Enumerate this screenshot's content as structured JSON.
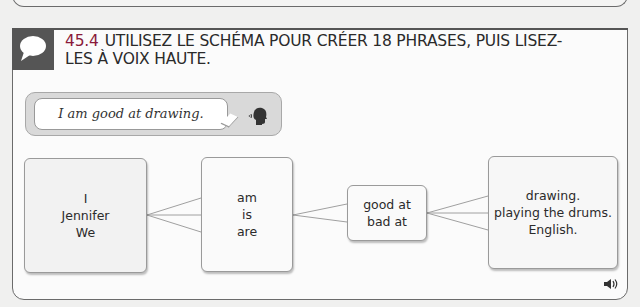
{
  "exercise": {
    "number": "45.4",
    "instruction": "UTILISEZ LE SCHÉMA POUR CRÉER 18 PHRASES, PUIS LISEZ-LES À VOIX HAUTE.",
    "badge_icon": "speech-bubble-icon",
    "example": {
      "sentence": "I am good at drawing.",
      "icon": "speaking-head-icon"
    },
    "diagram": {
      "subjects": [
        "I",
        "Jennifer",
        "We"
      ],
      "verbs": [
        "am",
        "is",
        "are"
      ],
      "skills": [
        "good at",
        "bad at"
      ],
      "objects": [
        "drawing.",
        "playing the drums.",
        "English."
      ]
    },
    "audio_icon": "speaker-icon"
  }
}
